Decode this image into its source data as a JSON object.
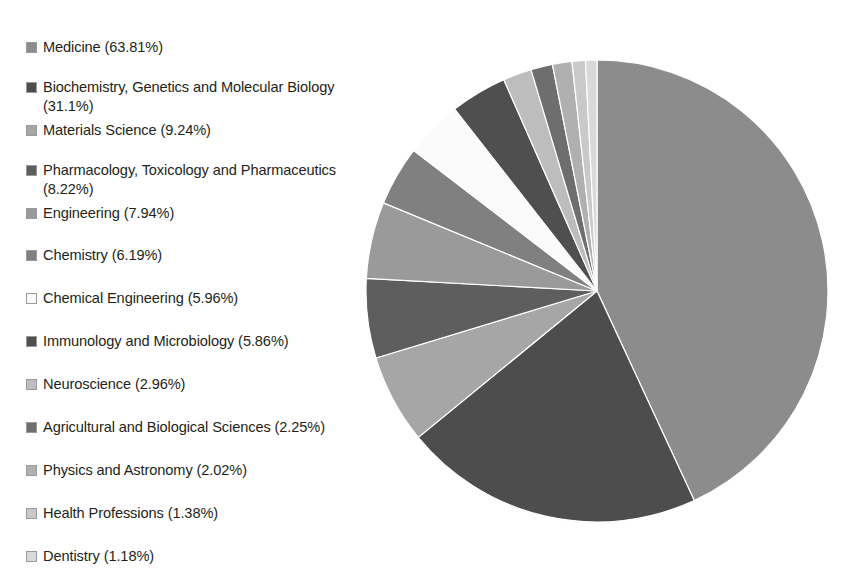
{
  "chart_data": {
    "type": "pie",
    "title": "",
    "subtitle": "",
    "xlabel": "",
    "ylabel": "",
    "legend_position": "left",
    "grid": false,
    "value_unit": "percent",
    "note": "Percentages are share of documents per subject area; categories overlap so values total more than 100% and slice angles are drawn proportionally.",
    "total_percent": 148.12,
    "categories": [
      "Medicine",
      "Biochemistry, Genetics and Molecular Biology",
      "Materials Science",
      "Pharmacology, Toxicology and Pharmaceutics",
      "Engineering",
      "Chemistry",
      "Chemical Engineering",
      "Immunology and Microbiology",
      "Neuroscience",
      "Agricultural and Biological Sciences",
      "Physics and Astronomy",
      "Health Professions",
      "Dentistry"
    ],
    "values": [
      63.81,
      31.1,
      9.24,
      8.22,
      7.94,
      6.19,
      5.96,
      5.86,
      2.96,
      2.25,
      2.02,
      1.38,
      1.18
    ],
    "value_labels": [
      "63.81%",
      "31.1%",
      "9.24%",
      "8.22%",
      "7.94%",
      "6.19%",
      "5.96%",
      "5.86%",
      "2.96%",
      "2.25%",
      "2.02%",
      "1.38%",
      "1.18%"
    ],
    "colors": [
      "#8c8c8c",
      "#4d4d4d",
      "#a6a6a6",
      "#5e5e5e",
      "#9a9a9a",
      "#808080",
      "#fbfbfb",
      "#4f4f4f",
      "#bdbdbd",
      "#6e6e6e",
      "#b0b0b0",
      "#c9c9c9",
      "#d9d9d9"
    ]
  },
  "legend": {
    "items": [
      {
        "label": "Medicine (63.81%)",
        "color": "#8c8c8c",
        "top": 8,
        "multiline": false
      },
      {
        "label": "Biochemistry, Genetics and Molecular Biology\n(31.1%)",
        "color": "#4d4d4d",
        "top": 48,
        "multiline": true
      },
      {
        "label": "Materials Science (9.24%)",
        "color": "#a6a6a6",
        "top": 91,
        "multiline": false
      },
      {
        "label": "Pharmacology, Toxicology and Pharmaceutics\n(8.22%)",
        "color": "#5e5e5e",
        "top": 131,
        "multiline": true
      },
      {
        "label": "Engineering (7.94%)",
        "color": "#9a9a9a",
        "top": 174,
        "multiline": false
      },
      {
        "label": "Chemistry (6.19%)",
        "color": "#808080",
        "top": 216,
        "multiline": false
      },
      {
        "label": "Chemical Engineering (5.96%)",
        "color": "#fbfbfb",
        "top": 259,
        "multiline": false
      },
      {
        "label": "Immunology and Microbiology (5.86%)",
        "color": "#4f4f4f",
        "top": 302,
        "multiline": false
      },
      {
        "label": "Neuroscience (2.96%)",
        "color": "#bdbdbd",
        "top": 345,
        "multiline": false
      },
      {
        "label": "Agricultural and Biological Sciences (2.25%)",
        "color": "#6e6e6e",
        "top": 388,
        "multiline": false
      },
      {
        "label": "Physics and Astronomy (2.02%)",
        "color": "#b0b0b0",
        "top": 431,
        "multiline": false
      },
      {
        "label": "Health Professions (1.38%)",
        "color": "#c9c9c9",
        "top": 474,
        "multiline": false
      },
      {
        "label": "Dentistry (1.18%)",
        "color": "#d9d9d9",
        "top": 517,
        "multiline": false
      }
    ]
  },
  "pie": {
    "center_x": 231,
    "center_y": 235,
    "radius": 231,
    "start_angle_deg": -90,
    "direction": "clockwise"
  }
}
